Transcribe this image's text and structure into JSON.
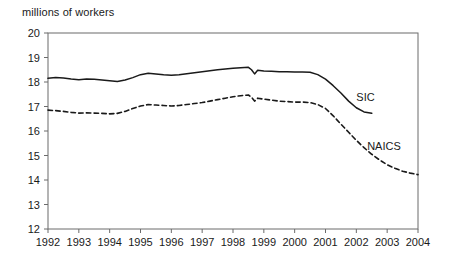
{
  "chart_data": {
    "type": "line",
    "title": "",
    "ylabel": "millions of workers",
    "xlabel": "",
    "ylim": [
      12,
      20
    ],
    "xlim": [
      1992,
      2004
    ],
    "grid": false,
    "legend_position": "inline-right",
    "ytick_labels": [
      "20",
      "19",
      "18",
      "17",
      "16",
      "15",
      "14",
      "13",
      "12"
    ],
    "ytick_values": [
      20,
      19,
      18,
      17,
      16,
      15,
      14,
      13,
      12
    ],
    "xtick_labels": [
      "1992",
      "1993",
      "1994",
      "1995",
      "1996",
      "1997",
      "1998",
      "1999",
      "2000",
      "2001",
      "2002",
      "2003",
      "2004"
    ],
    "xtick_values": [
      1992,
      1993,
      1994,
      1995,
      1996,
      1997,
      1998,
      1999,
      2000,
      2001,
      2002,
      2003,
      2004
    ],
    "series": [
      {
        "name": "SIC",
        "style": "solid",
        "color": "#1a1a1a",
        "label_x": 2002.0,
        "label_y": 17.35,
        "x": [
          1992.0,
          1992.25,
          1992.5,
          1992.75,
          1993.0,
          1993.25,
          1993.5,
          1993.75,
          1994.0,
          1994.25,
          1994.5,
          1994.75,
          1995.0,
          1995.25,
          1995.5,
          1995.75,
          1996.0,
          1996.25,
          1996.5,
          1996.75,
          1997.0,
          1997.25,
          1997.5,
          1997.75,
          1998.0,
          1998.25,
          1998.5,
          1998.6,
          1998.7,
          1998.8,
          1999.0,
          1999.25,
          1999.5,
          1999.75,
          2000.0,
          2000.25,
          2000.5,
          2000.75,
          2001.0,
          2001.25,
          2001.5,
          2001.75,
          2002.0,
          2002.25,
          2002.5
        ],
        "values": [
          18.15,
          18.18,
          18.16,
          18.12,
          18.09,
          18.12,
          18.11,
          18.08,
          18.05,
          18.02,
          18.08,
          18.18,
          18.3,
          18.36,
          18.33,
          18.3,
          18.28,
          18.3,
          18.34,
          18.38,
          18.42,
          18.46,
          18.5,
          18.53,
          18.56,
          18.58,
          18.6,
          18.5,
          18.33,
          18.48,
          18.45,
          18.44,
          18.42,
          18.42,
          18.41,
          18.41,
          18.4,
          18.3,
          18.12,
          17.85,
          17.55,
          17.22,
          16.95,
          16.78,
          16.72
        ]
      },
      {
        "name": "NAICS",
        "style": "dashed",
        "color": "#1a1a1a",
        "label_x": 2002.35,
        "label_y": 15.35,
        "x": [
          1992.0,
          1992.25,
          1992.5,
          1992.75,
          1993.0,
          1993.25,
          1993.5,
          1993.75,
          1994.0,
          1994.25,
          1994.5,
          1994.75,
          1995.0,
          1995.25,
          1995.5,
          1995.75,
          1996.0,
          1996.25,
          1996.5,
          1996.75,
          1997.0,
          1997.25,
          1997.5,
          1997.75,
          1998.0,
          1998.25,
          1998.5,
          1998.6,
          1998.7,
          1998.8,
          1999.0,
          1999.25,
          1999.5,
          1999.75,
          2000.0,
          2000.25,
          2000.5,
          2000.75,
          2001.0,
          2001.25,
          2001.5,
          2001.75,
          2002.0,
          2002.25,
          2002.5,
          2002.75,
          2003.0,
          2003.25,
          2003.5,
          2003.75,
          2004.0
        ],
        "values": [
          16.85,
          16.83,
          16.8,
          16.76,
          16.73,
          16.74,
          16.73,
          16.72,
          16.7,
          16.72,
          16.8,
          16.92,
          17.02,
          17.08,
          17.06,
          17.04,
          17.02,
          17.04,
          17.08,
          17.12,
          17.16,
          17.22,
          17.28,
          17.34,
          17.4,
          17.44,
          17.47,
          17.38,
          17.22,
          17.34,
          17.3,
          17.26,
          17.22,
          17.2,
          17.18,
          17.18,
          17.16,
          17.08,
          16.92,
          16.62,
          16.28,
          15.95,
          15.62,
          15.32,
          15.05,
          14.82,
          14.62,
          14.48,
          14.36,
          14.28,
          14.22
        ]
      }
    ]
  }
}
